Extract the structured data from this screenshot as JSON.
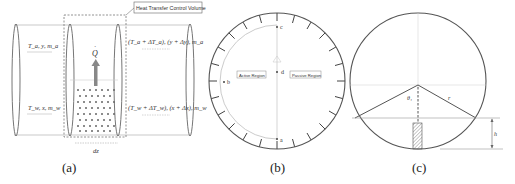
{
  "panel_a": {
    "caption": "(a)",
    "control_volume_label": "Heat Transfer Control Volume",
    "heat_label": "Q",
    "inlet_top": "T_a, y, m_a",
    "inlet_bottom": "T_w, x, m_w",
    "outlet_top": "(T_a + ΔT_a), (y + Δy), m_a",
    "outlet_bottom": "(T_w + ΔT_w), (x + Δx), m_w",
    "length_label": "dz"
  },
  "panel_b": {
    "caption": "(b)",
    "active_region": "Active Region",
    "passive_region": "Passive Region",
    "points": [
      "a",
      "b",
      "c",
      "d"
    ]
  },
  "panel_c": {
    "caption": "(c)",
    "angle_label": "θ₁",
    "radius_label": "r",
    "height_label": "h"
  },
  "colors": {
    "stroke": "#555555",
    "light_stroke": "#bbbbbb",
    "arrow": "#777777"
  }
}
